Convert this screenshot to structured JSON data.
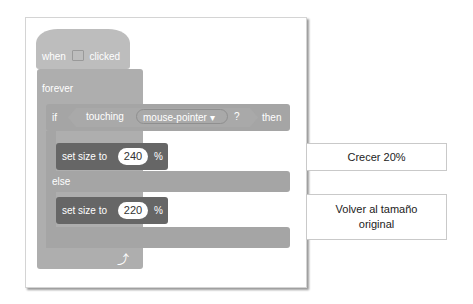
{
  "script": {
    "hat": {
      "label_when": "when",
      "icon": "green-flag-icon",
      "label_clicked": "clicked"
    },
    "forever": {
      "label": "forever",
      "icon": "loop-arrow-icon"
    },
    "if_block": {
      "label_if": "if",
      "condition": {
        "label": "touching",
        "dropdown_value": "mouse-pointer",
        "dropdown_arrow": "▾",
        "question": "?"
      },
      "label_then": "then",
      "label_else": "else"
    },
    "set_size_1": {
      "label": "set size to",
      "value": "240",
      "unit": "%"
    },
    "set_size_2": {
      "label": "set size to",
      "value": "220",
      "unit": "%"
    }
  },
  "annotations": [
    {
      "text": "Crecer 20%"
    },
    {
      "text": "Volver al tamaño original"
    }
  ]
}
